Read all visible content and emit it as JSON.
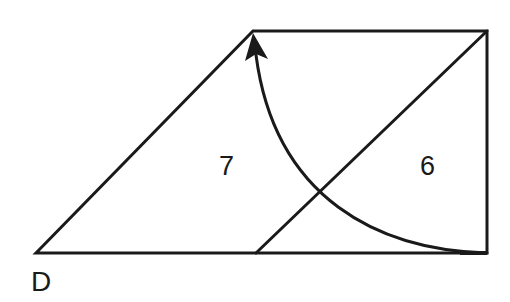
{
  "diagram": {
    "labels": {
      "vertex_bottom_left": "D",
      "region_left": "7",
      "region_right": "6"
    },
    "stroke_color": "#1a1a1a",
    "background": "#ffffff"
  }
}
